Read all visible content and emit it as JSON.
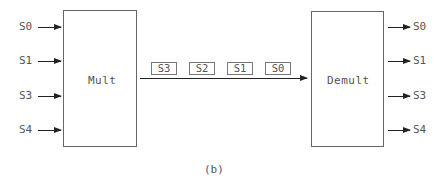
{
  "diagram": {
    "mux": {
      "label": "Mult",
      "inputs": [
        "S0",
        "S1",
        "S3",
        "S4"
      ]
    },
    "demux": {
      "label": "Demult",
      "outputs": [
        "S0",
        "S1",
        "S3",
        "S4"
      ]
    },
    "channel_packets": [
      "S3",
      "S2",
      "S1",
      "S0"
    ],
    "caption": "(b)"
  }
}
